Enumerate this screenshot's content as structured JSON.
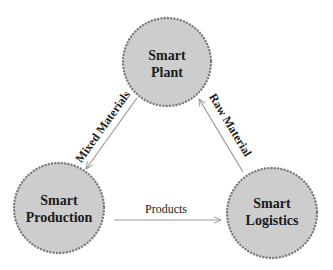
{
  "diagram": {
    "type": "triangular flow diagram",
    "colors": {
      "node_fill": "#cdcdcd",
      "node_border": "#7a7a7a",
      "edge": "#9a9a9a",
      "text": "#1a1a1a"
    },
    "nodes": [
      {
        "id": "plant",
        "line1": "Smart",
        "line2": "Plant"
      },
      {
        "id": "production",
        "line1": "Smart",
        "line2": "Production"
      },
      {
        "id": "logistics",
        "line1": "Smart",
        "line2": "Logistics"
      }
    ],
    "edges": [
      {
        "from": "plant",
        "to": "production",
        "label": "Mixed Materials"
      },
      {
        "from": "production",
        "to": "logistics",
        "label": "Products"
      },
      {
        "from": "logistics",
        "to": "plant",
        "label": "Raw Material"
      }
    ]
  }
}
